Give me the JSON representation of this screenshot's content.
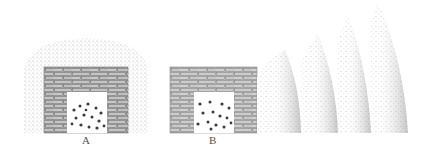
{
  "figure": {
    "panels": [
      {
        "id": "A",
        "label": "A",
        "description": "brick enclosure with stippled halo surrounding it"
      },
      {
        "id": "B",
        "label": "B",
        "description": "brick enclosure with radiating stippled arcs to the right"
      }
    ],
    "arcs_count": 4,
    "colors": {
      "background": "#ffffff",
      "stipple": "#8a8a8a",
      "brick_line": "#6e6e6e",
      "ink": "#444444"
    }
  }
}
